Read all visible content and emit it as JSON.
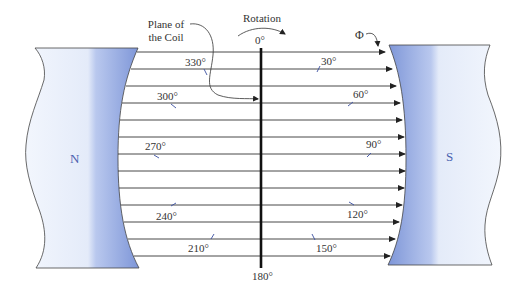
{
  "diagram": {
    "title_labels": {
      "plane_of_coil": [
        "Plane of",
        "the Coil"
      ],
      "rotation": "Rotation",
      "flux": "Φ"
    },
    "poles": {
      "north": "N",
      "south": "S"
    },
    "angles": {
      "a0": "0°",
      "a30": "30°",
      "a60": "60°",
      "a90": "90°",
      "a120": "120°",
      "a150": "150°",
      "a180": "180°",
      "a210": "210°",
      "a240": "240°",
      "a270": "270°",
      "a300": "300°",
      "a330": "330°"
    },
    "colors": {
      "magnet_light": "#eef3fc",
      "magnet_dark": "#7f97d6",
      "line": "#333333",
      "pole_text": "#4a62b0",
      "coil": "#111111"
    },
    "field_line_count": 13
  }
}
